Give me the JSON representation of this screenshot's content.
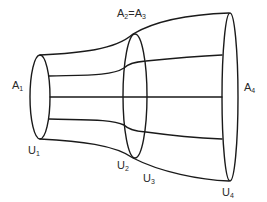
{
  "diagram": {
    "type": "stream-tube",
    "stroke_color": "#1a1a1a",
    "background": "#ffffff",
    "cross_sections": [
      {
        "id": "A1",
        "label_base": "A",
        "label_sub": "1",
        "velocity_base": "U",
        "velocity_sub": "1"
      },
      {
        "id": "A2",
        "label_base": "A",
        "label_sub": "2",
        "velocity_base": "U",
        "velocity_sub": "2"
      },
      {
        "id": "A3",
        "label_base": "A",
        "label_sub": "3",
        "velocity_base": "U",
        "velocity_sub": "3"
      },
      {
        "id": "A4",
        "label_base": "A",
        "label_sub": "4",
        "velocity_base": "U",
        "velocity_sub": "4"
      }
    ],
    "labels": {
      "a1": {
        "base": "A",
        "sub": "1"
      },
      "a2_eq_a3": {
        "base1": "A",
        "sub1": "2",
        "eq": "=",
        "base2": "A",
        "sub2": "3"
      },
      "a4": {
        "base": "A",
        "sub": "4"
      },
      "u1": {
        "base": "U",
        "sub": "1"
      },
      "u2": {
        "base": "U",
        "sub": "2"
      },
      "u3": {
        "base": "U",
        "sub": "3"
      },
      "u4": {
        "base": "U",
        "sub": "4"
      }
    }
  }
}
